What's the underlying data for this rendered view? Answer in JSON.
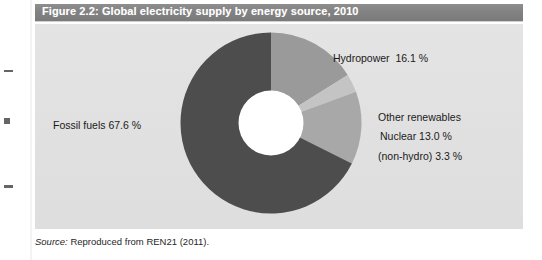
{
  "figure": {
    "title": "Figure 2.2: Global electricity supply by energy source, 2010",
    "source_word": "Source:",
    "source_text": " Reproduced from REN21 (2011)."
  },
  "colors": {
    "title_bar": "#828282",
    "title_text": "#ffffff",
    "panel_background": "#e2e2e2",
    "fossil_fuels": "#4d4d4d",
    "hydropower": "#9a9a9a",
    "other_renewables": "#c4c4c4",
    "nuclear": "#a8a8a8",
    "hole": "#ffffff"
  },
  "chart_data": {
    "type": "pie",
    "title": "Figure 2.2: Global electricity supply by energy source, 2010",
    "subtitle": "",
    "xlabel": "",
    "ylabel": "",
    "legend_position": "none",
    "grid": false,
    "donut_hole_ratio": 0.36,
    "start_angle_deg": 0,
    "direction": "clockwise",
    "unit": "%",
    "categories": [
      "Hydropower",
      "Other renewables (non-hydro)",
      "Nuclear",
      "Fossil fuels"
    ],
    "values": [
      16.1,
      3.3,
      13.0,
      67.6
    ],
    "labels": [
      "Hydropower  16.1 %",
      "Other renewables\n(non-hydro) 3.3 %",
      "Nuclear 13.0 %",
      "Fossil fuels 67.6 %"
    ],
    "slice_colors": [
      "#9a9a9a",
      "#c4c4c4",
      "#a8a8a8",
      "#4d4d4d"
    ],
    "annotations": [
      "Source: Reproduced from REN21 (2011)."
    ]
  },
  "slice_labels": {
    "hydropower": "Hydropower  16.1 %",
    "other_renewables_line1": "Other renewables",
    "other_renewables_line2": "(non-hydro) 3.3 %",
    "nuclear": "Nuclear 13.0 %",
    "fossil_fuels": "Fossil fuels 67.6 %"
  }
}
